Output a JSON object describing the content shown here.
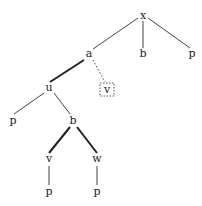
{
  "tree": {
    "nodes": [
      {
        "id": "n-x",
        "label": "x",
        "x": 143,
        "y": 19
      },
      {
        "id": "n-a",
        "label": "a",
        "x": 89,
        "y": 57
      },
      {
        "id": "n-b1",
        "label": "b",
        "x": 143,
        "y": 57
      },
      {
        "id": "n-p1",
        "label": "p",
        "x": 192,
        "y": 57
      },
      {
        "id": "n-u",
        "label": "u",
        "x": 49,
        "y": 91
      },
      {
        "id": "n-v1",
        "label": "v",
        "x": 107,
        "y": 92,
        "boxed": true
      },
      {
        "id": "n-p2",
        "label": "p",
        "x": 13,
        "y": 123
      },
      {
        "id": "n-b2",
        "label": "b",
        "x": 73,
        "y": 123
      },
      {
        "id": "n-v2",
        "label": "v",
        "x": 49,
        "y": 162
      },
      {
        "id": "n-w",
        "label": "w",
        "x": 97,
        "y": 162
      },
      {
        "id": "n-p3",
        "label": "p",
        "x": 49,
        "y": 194
      },
      {
        "id": "n-p4",
        "label": "p",
        "x": 97,
        "y": 194
      }
    ],
    "edges": [
      {
        "from": "n-x",
        "to": "n-a",
        "style": "thin"
      },
      {
        "from": "n-x",
        "to": "n-b1",
        "style": "thin"
      },
      {
        "from": "n-x",
        "to": "n-p1",
        "style": "thin"
      },
      {
        "from": "n-a",
        "to": "n-u",
        "style": "thick"
      },
      {
        "from": "n-a",
        "to": "n-v1",
        "style": "dotted"
      },
      {
        "from": "n-u",
        "to": "n-p2",
        "style": "thin"
      },
      {
        "from": "n-u",
        "to": "n-b2",
        "style": "thin"
      },
      {
        "from": "n-b2",
        "to": "n-v2",
        "style": "thick"
      },
      {
        "from": "n-b2",
        "to": "n-w",
        "style": "thick"
      },
      {
        "from": "n-v2",
        "to": "n-p3",
        "style": "thin"
      },
      {
        "from": "n-w",
        "to": "n-p4",
        "style": "thin"
      }
    ]
  },
  "colors": {
    "line": "#333333",
    "text": "#222222"
  }
}
